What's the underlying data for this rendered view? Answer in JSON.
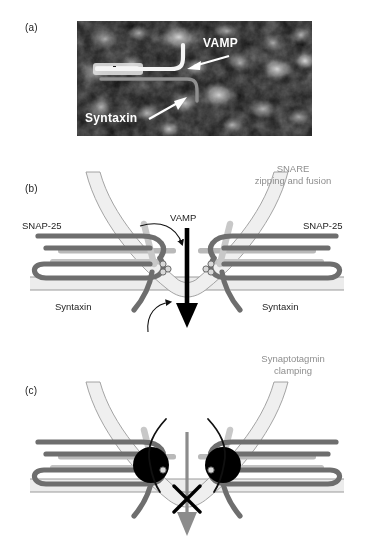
{
  "figure": {
    "type": "scientific-figure",
    "background_color": "#ffffff"
  },
  "panels": [
    {
      "id": "a",
      "label": "(a)",
      "kind": "electron-micrograph",
      "annotations": [
        {
          "name": "vamp",
          "text": "VAMP",
          "color": "#ffffff",
          "style": "bold"
        },
        {
          "name": "syntaxin",
          "text": "Syntaxin",
          "color": "#ffffff",
          "style": "bold"
        }
      ]
    },
    {
      "id": "b",
      "label": "(b)",
      "kind": "schematic",
      "caption": {
        "line1": "SNARE",
        "line2": "zipping and fusion",
        "color": "#a0a0a0"
      },
      "labels": [
        {
          "name": "snap25-left",
          "text": "SNAP-25"
        },
        {
          "name": "snap25-right",
          "text": "SNAP-25"
        },
        {
          "name": "vamp",
          "text": "VAMP"
        },
        {
          "name": "syntaxin-left",
          "text": "Syntaxin"
        },
        {
          "name": "syntaxin-right",
          "text": "Syntaxin"
        }
      ],
      "arrow": {
        "name": "fusion-arrow",
        "color": "#000000",
        "direction": "down"
      }
    },
    {
      "id": "c",
      "label": "(c)",
      "kind": "schematic",
      "caption": {
        "line1": "Synaptotagmin",
        "line2": "clamping",
        "color": "#a0a0a0"
      },
      "labels": [],
      "arrow": {
        "name": "blocked-fusion-arrow",
        "color": "#8c8c8c",
        "direction": "down"
      },
      "block_symbol": {
        "name": "x-cross",
        "text": "X",
        "color": "#000000"
      },
      "synaptotagmin": {
        "name": "synaptotagmin-disc",
        "color": "#000000",
        "count": 2
      }
    }
  ],
  "colors": {
    "syntaxin_helix": "#6e6e6e",
    "snap25_helix": "#b4b4b4",
    "vamp_helix": "#c8c8c8",
    "membrane_fill": "#ececec",
    "membrane_stroke": "#9a9a9a",
    "vesicle_fill": "#efefef",
    "text_dark": "#1d1d1d",
    "text_gray": "#9e9e9e",
    "black": "#000000"
  }
}
